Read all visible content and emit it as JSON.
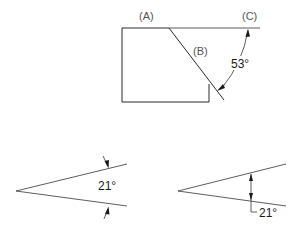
{
  "figure_top": {
    "labels": {
      "a": "(A)",
      "b": "(B)",
      "c": "(C)"
    },
    "angle": "53°"
  },
  "figure_bottom_left": {
    "angle": "21°"
  },
  "figure_bottom_right": {
    "angle": "21°"
  },
  "colors": {
    "line": "#2a2a2a",
    "label": "#555555",
    "text": "#1a1a1a",
    "background": "#ffffff"
  }
}
